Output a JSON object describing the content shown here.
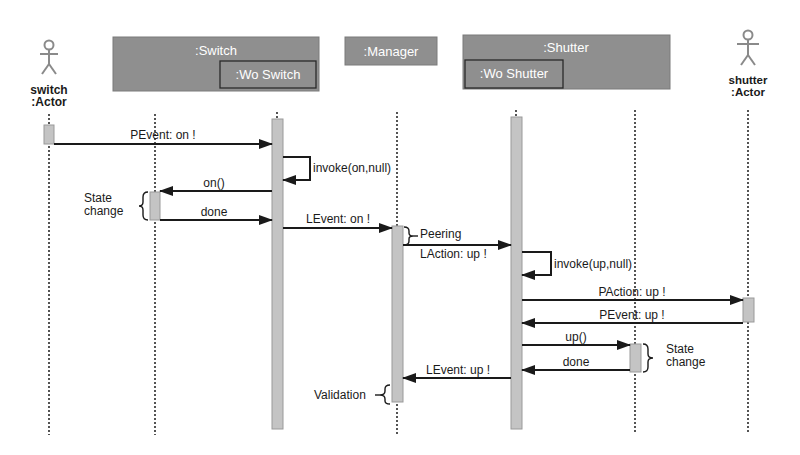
{
  "diagram": {
    "type": "sequence",
    "colors": {
      "box_fill": "#8f8f8f",
      "box_border": "#707070",
      "inner_border": "#2a2a2a",
      "activation_fill": "#c4c4c4",
      "line": "#1a1a1a",
      "actor": "#8a8a8a"
    },
    "participants": [
      {
        "id": "switch_actor",
        "kind": "actor",
        "label_line1": "switch",
        "label_line2": ":Actor"
      },
      {
        "id": "switch",
        "kind": "box",
        "label": ":Switch",
        "inner_label": ":Wo Switch"
      },
      {
        "id": "manager",
        "kind": "box",
        "label": ":Manager"
      },
      {
        "id": "shutter",
        "kind": "box",
        "label": ":Shutter",
        "inner_label": ":Wo Shutter"
      },
      {
        "id": "shutter_actor",
        "kind": "actor",
        "label_line1": "shutter",
        "label_line2": ":Actor"
      }
    ],
    "messages": [
      {
        "from": "switch:Actor",
        "to": ":Switch",
        "label": "PEvent: on !"
      },
      {
        "from": ":Switch",
        "to": ":Switch",
        "label": "invoke(on,null)"
      },
      {
        "from": ":Switch",
        "to": ":Wo Switch",
        "label": "on()"
      },
      {
        "from": ":Wo Switch",
        "to": ":Switch",
        "label": "done"
      },
      {
        "from": ":Switch",
        "to": ":Manager",
        "label": "LEvent: on !"
      },
      {
        "from": ":Manager",
        "to": ":Shutter",
        "label": "LAction: up !"
      },
      {
        "from": ":Shutter",
        "to": ":Shutter",
        "label": "invoke(up,null)"
      },
      {
        "from": ":Shutter",
        "to": "shutter:Actor",
        "label": "PAction: up !"
      },
      {
        "from": "shutter:Actor",
        "to": ":Shutter",
        "label": "PEvent: up !"
      },
      {
        "from": ":Shutter",
        "to": ":Wo Shutter",
        "label": "up()"
      },
      {
        "from": ":Wo Shutter",
        "to": ":Shutter",
        "label": "done"
      },
      {
        "from": ":Shutter",
        "to": ":Manager",
        "label": "LEvent: up !"
      }
    ],
    "annotations": {
      "state_change_left_1": "State",
      "state_change_left_2": "change",
      "peering": "Peering",
      "state_change_right_1": "State",
      "state_change_right_2": "change",
      "validation": "Validation"
    }
  }
}
